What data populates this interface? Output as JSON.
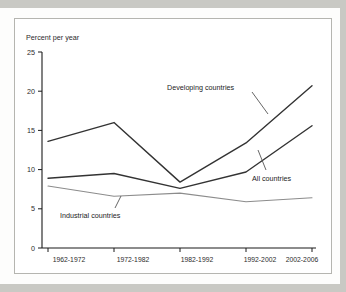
{
  "chart_data": {
    "type": "line",
    "title": "",
    "subtitle": "",
    "ylabel": "Percent per year",
    "xlabel": "",
    "categories": [
      "1962-1972",
      "1972-1982",
      "1982-1992",
      "1992-2002",
      "2002-2006"
    ],
    "ylim": [
      0,
      25
    ],
    "yticks": [
      0,
      5,
      10,
      15,
      20,
      25
    ],
    "ytick_labels": [
      "0",
      "5",
      "10",
      "15",
      "20",
      "25"
    ],
    "grid": false,
    "legend_position": "inline-annotations",
    "series": [
      {
        "name": "Developing countries",
        "values": [
          13.6,
          16.0,
          8.4,
          13.4,
          20.7
        ],
        "color": "#333333",
        "width": 1.4
      },
      {
        "name": "All countries",
        "values": [
          8.9,
          9.5,
          7.6,
          9.7,
          15.6
        ],
        "color": "#333333",
        "width": 1.4
      },
      {
        "name": "Industrial countries",
        "values": [
          7.9,
          6.6,
          7.0,
          5.9,
          6.4
        ],
        "color": "#8c8c8c",
        "width": 1.1
      }
    ],
    "annotations": [
      {
        "text": "Developing countries",
        "series": "Developing countries"
      },
      {
        "text": "All countries",
        "series": "All countries"
      },
      {
        "text": "Industrial countries",
        "series": "Industrial countries"
      }
    ]
  },
  "colors": {
    "page_background": "#c9c9c4",
    "sheet_background": "#fdfdfc",
    "plot_background": "#ffffff",
    "frame_border": "#b5b5b0",
    "axis": "#1a1a1a",
    "text": "#2b2b2b",
    "dark_series": "#333333",
    "light_series": "#8c8c8c"
  }
}
